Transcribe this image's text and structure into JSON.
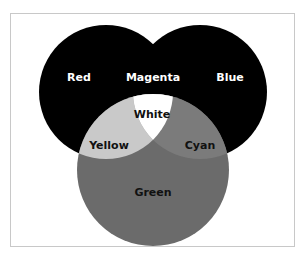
{
  "diagram": {
    "type": "venn",
    "frame": {
      "border_color": "#c8c8c8",
      "background": "#ffffff"
    },
    "circles": [
      {
        "id": "red",
        "label": "Red",
        "fill": "#000000",
        "cx": 106,
        "cy": 92,
        "r": 67
      },
      {
        "id": "blue",
        "label": "Blue",
        "fill": "#000000",
        "cx": 200,
        "cy": 92,
        "r": 67
      },
      {
        "id": "green",
        "label": "Green",
        "fill": "#6b6b6b",
        "cx": 153,
        "cy": 170,
        "r": 76
      }
    ],
    "regions": {
      "red": {
        "label": "Red",
        "color": "#000000",
        "text_color": "#ffffff"
      },
      "blue": {
        "label": "Blue",
        "color": "#000000",
        "text_color": "#ffffff"
      },
      "green": {
        "label": "Green",
        "color": "#6b6b6b",
        "text_color": "#111111"
      },
      "magenta": {
        "label": "Magenta",
        "color": "#000000",
        "text_color": "#ffffff"
      },
      "yellow": {
        "label": "Yellow",
        "color": "#c9c9c9",
        "text_color": "#111111"
      },
      "cyan": {
        "label": "Cyan",
        "color": "#7b7b7b",
        "text_color": "#111111"
      },
      "white": {
        "label": "White",
        "color": "#ffffff",
        "text_color": "#111111"
      }
    }
  }
}
